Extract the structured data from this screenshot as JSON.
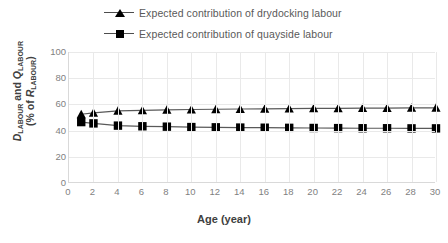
{
  "legend": {
    "position": "top-center",
    "items": [
      {
        "label": "Expected contribution of drydocking labour",
        "marker": "triangle",
        "color": "#000000"
      },
      {
        "label": "Expected contribution of quayside labour",
        "marker": "square",
        "color": "#000000"
      }
    ]
  },
  "axes": {
    "x": {
      "title": "Age (year)",
      "ticks": [
        0,
        2,
        4,
        6,
        8,
        10,
        12,
        14,
        16,
        18,
        20,
        22,
        24,
        26,
        28,
        30
      ],
      "min": 0,
      "max": 30
    },
    "y": {
      "title_main": "D",
      "title_sub1": "LABOUR",
      "title_mid": " and ",
      "title_main2": "Q",
      "title_sub2": "LABOUR",
      "title_line2_pre": "(% of ",
      "title_line2_var": "R",
      "title_line2_sub": "LABOUR",
      "title_line2_post": ")",
      "ticks": [
        0,
        20,
        40,
        60,
        80,
        100
      ],
      "min": 0,
      "max": 100
    }
  },
  "chart_data": {
    "type": "line",
    "title": "",
    "xlabel": "Age (year)",
    "ylabel": "D_LABOUR and Q_LABOUR (% of R_LABOUR)",
    "xlim": [
      0,
      30
    ],
    "ylim": [
      0,
      100
    ],
    "grid": true,
    "legend_position": "top-center",
    "x": [
      1,
      2,
      4,
      6,
      8,
      10,
      12,
      14,
      16,
      18,
      20,
      22,
      24,
      26,
      28,
      30
    ],
    "series": [
      {
        "name": "Expected contribution of drydocking labour",
        "marker": "triangle",
        "color": "#000000",
        "values": [
          52.5,
          53.5,
          55.0,
          55.4,
          55.8,
          56.1,
          56.3,
          56.5,
          56.6,
          56.8,
          56.9,
          57.0,
          57.1,
          57.2,
          57.3,
          57.4
        ]
      },
      {
        "name": "Expected contribution of quayside labour",
        "marker": "square",
        "color": "#000000",
        "values": [
          46.5,
          45.5,
          43.8,
          43.3,
          43.0,
          42.7,
          42.5,
          42.3,
          42.2,
          42.1,
          42.0,
          41.9,
          41.8,
          41.8,
          41.7,
          41.7
        ]
      }
    ]
  }
}
